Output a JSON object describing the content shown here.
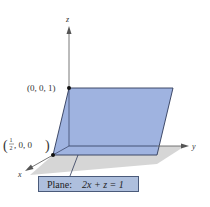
{
  "figure": {
    "axes": {
      "x_label": "x",
      "y_label": "y",
      "z_label": "z"
    },
    "points": [
      {
        "label": "(0, 0, 1)",
        "coords": [
          0,
          0,
          1
        ]
      },
      {
        "label_num": "1",
        "label_den": "2",
        "label_rest": ", 0, 0",
        "coords": [
          0.5,
          0,
          0
        ]
      }
    ],
    "plane": {
      "caption_prefix": "Plane:",
      "equation": "2x + z = 1",
      "fill_color": "#9fb3e0",
      "edge_color": "#2f3a5a",
      "shadow_color": "#c8c8c8"
    }
  }
}
